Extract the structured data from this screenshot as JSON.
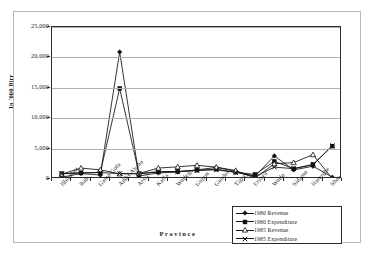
{
  "chart_data": {
    "type": "line",
    "title": "",
    "xlabel": "Province",
    "ylabel": "In '000 Birr",
    "ylim": [
      0,
      25000
    ],
    "yticks": [
      "0",
      "5,000",
      "10,000",
      "15,000",
      "20,000",
      "25,000"
    ],
    "ytick_values": [
      0,
      5000,
      10000,
      15000,
      20000,
      25000
    ],
    "grid": true,
    "legend_position": "bottom-right",
    "categories": [
      "Illubabor",
      "Bale",
      "Gamo Gofa",
      "Addis Ababa",
      "Arssi",
      "Kaffa",
      "Wollega",
      "Gojam",
      "Gonder",
      "Tigray",
      "Eritrea",
      "Wollo",
      "Sidamo",
      "Harerghe",
      "Shoa"
    ],
    "series": [
      {
        "name": "1980 Revenue",
        "marker": "filled-diamond",
        "values": [
          300,
          900,
          650,
          20900,
          500,
          1000,
          1150,
          1500,
          1900,
          1250,
          450,
          3800,
          1500,
          2100,
          300
        ]
      },
      {
        "name": "1980 Expenditure",
        "marker": "filled-square",
        "values": [
          900,
          1000,
          1100,
          14900,
          900,
          1200,
          1250,
          1450,
          1600,
          1100,
          750,
          2900,
          1700,
          2400,
          5400
        ]
      },
      {
        "name": "1985 Revenue",
        "marker": "open-triangle",
        "values": [
          800,
          1800,
          1500,
          850,
          900,
          1800,
          2000,
          2250,
          1950,
          1400,
          150,
          2500,
          2700,
          4000,
          50
        ]
      },
      {
        "name": "1985 Expenditure",
        "marker": "cross",
        "values": [
          850,
          1000,
          1050,
          900,
          850,
          1150,
          1200,
          1400,
          1500,
          1100,
          400,
          1950,
          1700,
          2350,
          5500
        ]
      }
    ]
  },
  "axes": {
    "y_title": "In '000 Birr",
    "x_title": "Province"
  }
}
